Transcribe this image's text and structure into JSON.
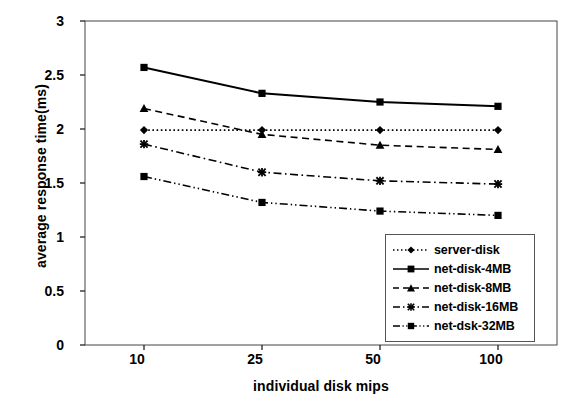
{
  "chart_data": {
    "type": "line",
    "title": "",
    "xlabel": "individual disk mips",
    "ylabel": "average response time(ms)",
    "categories": [
      "10",
      "25",
      "50",
      "100"
    ],
    "x_tick_labels": [
      "10",
      "25",
      "50",
      "100"
    ],
    "y_tick_labels": [
      "0",
      "0.5",
      "1",
      "1.5",
      "2",
      "2.5",
      "3"
    ],
    "y_ticks": [
      0,
      0.5,
      1,
      1.5,
      2,
      2.5,
      3
    ],
    "ylim": [
      0,
      3
    ],
    "grid": false,
    "legend_position": "lower-right-inside",
    "series": [
      {
        "name": "server-disk",
        "values": [
          1.99,
          1.99,
          1.99,
          1.99
        ],
        "marker": "diamond",
        "dash": "dotted",
        "color": "#000000"
      },
      {
        "name": "net-disk-4MB",
        "values": [
          2.57,
          2.33,
          2.25,
          2.21
        ],
        "marker": "square",
        "dash": "solid",
        "color": "#000000"
      },
      {
        "name": "net-disk-8MB",
        "values": [
          2.19,
          1.95,
          1.85,
          1.81
        ],
        "marker": "triangle",
        "dash": "dashed",
        "color": "#000000"
      },
      {
        "name": "net-disk-16MB",
        "values": [
          1.86,
          1.6,
          1.52,
          1.49
        ],
        "marker": "x",
        "dash": "dashdot",
        "color": "#000000"
      },
      {
        "name": "net-dsk-32MB",
        "values": [
          1.56,
          1.32,
          1.24,
          1.2
        ],
        "marker": "square",
        "dash": "dashdotdot",
        "color": "#000000"
      }
    ]
  },
  "legend": {
    "entries": [
      {
        "label": "server-disk"
      },
      {
        "label": "net-disk-4MB"
      },
      {
        "label": "net-disk-8MB"
      },
      {
        "label": "net-disk-16MB"
      },
      {
        "label": "net-dsk-32MB"
      }
    ]
  },
  "axes": {
    "y_title": "average response time(ms)",
    "x_title": "individual disk mips"
  }
}
